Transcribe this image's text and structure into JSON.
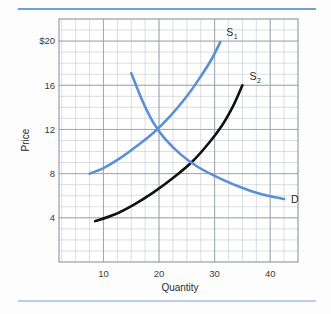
{
  "figure": {
    "background_color": "#fdfdfd",
    "top_rule_color": "#6e9ede",
    "bottom_rule_color": "#b9cfe8"
  },
  "chart_data": {
    "type": "line",
    "title": "",
    "xlabel": "Quantity",
    "ylabel": "Price",
    "xlim": [
      2,
      45
    ],
    "ylim": [
      0,
      22
    ],
    "grid": true,
    "grid_color": "#b6bcc4",
    "minor_grid_step_x": 2.5,
    "minor_grid_step_y": 1,
    "legend_position": "inline-end-labels",
    "xticks": [
      10,
      20,
      30,
      40
    ],
    "xtick_labels": [
      "10",
      "20",
      "30",
      "40"
    ],
    "yticks": [
      4,
      8,
      12,
      16,
      20
    ],
    "ytick_labels": [
      "4",
      "8",
      "12",
      "16",
      "$20"
    ],
    "series": [
      {
        "name": "S1",
        "label": "S",
        "label_sub": "1",
        "color": "#5b8fd6",
        "kind": "supply",
        "x": [
          7.5,
          10.0,
          13.0,
          16.0,
          19.0,
          22.0,
          25.0,
          27.5,
          29.5,
          31.0
        ],
        "y": [
          8.0,
          8.5,
          9.4,
          10.5,
          11.7,
          13.2,
          15.0,
          16.8,
          18.4,
          19.9
        ]
      },
      {
        "name": "S2",
        "label": "S",
        "label_sub": "2",
        "color": "#111111",
        "kind": "supply",
        "x": [
          8.5,
          12.0,
          15.5,
          19.0,
          22.5,
          26.0,
          29.0,
          31.5,
          33.5,
          35.0
        ],
        "y": [
          3.7,
          4.3,
          5.2,
          6.3,
          7.6,
          9.1,
          10.8,
          12.5,
          14.3,
          16.0
        ]
      },
      {
        "name": "D",
        "label": "D",
        "label_sub": "",
        "color": "#5b8fd6",
        "kind": "demand",
        "x": [
          15.0,
          17.0,
          19.0,
          21.0,
          24.0,
          27.0,
          30.0,
          34.0,
          38.0,
          42.5
        ],
        "y": [
          17.1,
          14.6,
          12.6,
          11.2,
          9.7,
          8.6,
          7.8,
          6.9,
          6.2,
          5.7
        ]
      }
    ],
    "intersections": [
      {
        "name": "equilibrium-S1-D",
        "x": 20.0,
        "y": 12.0
      },
      {
        "name": "equilibrium-S2-D",
        "x": 26.0,
        "y": 9.0
      }
    ]
  }
}
